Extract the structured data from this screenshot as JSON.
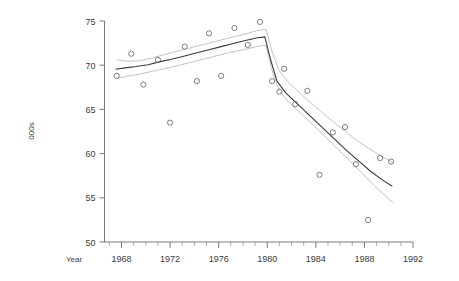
{
  "chart_data": {
    "type": "scatter",
    "title": "",
    "xlabel": "Year",
    "ylabel": "000s",
    "xlim": [
      1966.6,
      1992.0
    ],
    "ylim": [
      50,
      75
    ],
    "xticks": [
      1968,
      1972,
      1976,
      1980,
      1984,
      1988,
      1992
    ],
    "xticklabels": [
      "1968",
      "1972",
      "1976",
      "1980",
      "1984",
      "1988",
      "1992"
    ],
    "xticks_minor_step": 1,
    "yticks": [
      50,
      55,
      60,
      65,
      70,
      75
    ],
    "yticklabels": [
      "50",
      "55",
      "60",
      "65",
      "70",
      "75"
    ],
    "grid": false,
    "legend": null,
    "points": [
      {
        "x": 1967.6,
        "y": 68.8
      },
      {
        "x": 1968.8,
        "y": 71.3
      },
      {
        "x": 1969.8,
        "y": 67.8
      },
      {
        "x": 1971.0,
        "y": 70.6
      },
      {
        "x": 1972.0,
        "y": 63.5
      },
      {
        "x": 1973.2,
        "y": 72.1
      },
      {
        "x": 1974.2,
        "y": 68.2
      },
      {
        "x": 1975.2,
        "y": 73.6
      },
      {
        "x": 1976.2,
        "y": 68.8
      },
      {
        "x": 1977.3,
        "y": 74.2
      },
      {
        "x": 1978.4,
        "y": 72.3
      },
      {
        "x": 1979.4,
        "y": 74.9
      },
      {
        "x": 1980.4,
        "y": 68.2
      },
      {
        "x": 1981.0,
        "y": 67.0
      },
      {
        "x": 1981.4,
        "y": 69.6
      },
      {
        "x": 1982.3,
        "y": 65.6
      },
      {
        "x": 1983.3,
        "y": 67.1
      },
      {
        "x": 1984.3,
        "y": 57.6
      },
      {
        "x": 1985.4,
        "y": 62.4
      },
      {
        "x": 1986.4,
        "y": 63.0
      },
      {
        "x": 1987.3,
        "y": 58.8
      },
      {
        "x": 1988.3,
        "y": 52.5
      },
      {
        "x": 1989.3,
        "y": 59.5
      },
      {
        "x": 1990.2,
        "y": 59.1
      }
    ],
    "fit_curve": [
      {
        "x": 1967.5,
        "y": 69.55
      },
      {
        "x": 1968.3,
        "y": 69.7
      },
      {
        "x": 1969.2,
        "y": 69.85
      },
      {
        "x": 1970.2,
        "y": 70.05
      },
      {
        "x": 1971.2,
        "y": 70.4
      },
      {
        "x": 1972.2,
        "y": 70.7
      },
      {
        "x": 1973.2,
        "y": 71.05
      },
      {
        "x": 1974.2,
        "y": 71.4
      },
      {
        "x": 1975.2,
        "y": 71.75
      },
      {
        "x": 1976.2,
        "y": 72.1
      },
      {
        "x": 1977.2,
        "y": 72.45
      },
      {
        "x": 1978.2,
        "y": 72.8
      },
      {
        "x": 1979.2,
        "y": 73.1
      },
      {
        "x": 1979.8,
        "y": 73.2
      },
      {
        "x": 1980.3,
        "y": 70.5
      },
      {
        "x": 1980.8,
        "y": 68.2
      },
      {
        "x": 1981.5,
        "y": 66.9
      },
      {
        "x": 1982.5,
        "y": 65.6
      },
      {
        "x": 1983.5,
        "y": 64.3
      },
      {
        "x": 1984.5,
        "y": 63.0
      },
      {
        "x": 1985.5,
        "y": 61.7
      },
      {
        "x": 1986.5,
        "y": 60.4
      },
      {
        "x": 1987.5,
        "y": 59.2
      },
      {
        "x": 1988.5,
        "y": 58.0
      },
      {
        "x": 1989.5,
        "y": 57.0
      },
      {
        "x": 1990.3,
        "y": 56.3
      }
    ],
    "upper_band": [
      {
        "x": 1967.6,
        "y": 70.6
      },
      {
        "x": 1968.5,
        "y": 70.45
      },
      {
        "x": 1969.5,
        "y": 70.5
      },
      {
        "x": 1970.5,
        "y": 70.8
      },
      {
        "x": 1971.5,
        "y": 71.2
      },
      {
        "x": 1972.5,
        "y": 71.55
      },
      {
        "x": 1973.5,
        "y": 71.9
      },
      {
        "x": 1974.5,
        "y": 72.25
      },
      {
        "x": 1975.5,
        "y": 72.6
      },
      {
        "x": 1976.5,
        "y": 72.95
      },
      {
        "x": 1977.5,
        "y": 73.3
      },
      {
        "x": 1978.5,
        "y": 73.65
      },
      {
        "x": 1979.3,
        "y": 73.95
      },
      {
        "x": 1979.9,
        "y": 74.05
      },
      {
        "x": 1980.4,
        "y": 71.5
      },
      {
        "x": 1981.0,
        "y": 69.3
      },
      {
        "x": 1981.8,
        "y": 68.0
      },
      {
        "x": 1982.8,
        "y": 66.7
      },
      {
        "x": 1983.8,
        "y": 65.5
      },
      {
        "x": 1984.8,
        "y": 64.3
      },
      {
        "x": 1985.8,
        "y": 63.2
      },
      {
        "x": 1986.8,
        "y": 62.1
      },
      {
        "x": 1987.8,
        "y": 61.1
      },
      {
        "x": 1988.8,
        "y": 60.2
      },
      {
        "x": 1989.8,
        "y": 59.4
      },
      {
        "x": 1990.4,
        "y": 59.0
      }
    ],
    "lower_band": [
      {
        "x": 1967.6,
        "y": 68.5
      },
      {
        "x": 1968.5,
        "y": 68.75
      },
      {
        "x": 1969.5,
        "y": 69.0
      },
      {
        "x": 1970.5,
        "y": 69.3
      },
      {
        "x": 1971.5,
        "y": 69.6
      },
      {
        "x": 1972.5,
        "y": 69.9
      },
      {
        "x": 1973.5,
        "y": 70.25
      },
      {
        "x": 1974.5,
        "y": 70.6
      },
      {
        "x": 1975.5,
        "y": 70.95
      },
      {
        "x": 1976.5,
        "y": 71.3
      },
      {
        "x": 1977.5,
        "y": 71.6
      },
      {
        "x": 1978.5,
        "y": 71.9
      },
      {
        "x": 1979.3,
        "y": 72.15
      },
      {
        "x": 1979.9,
        "y": 72.25
      },
      {
        "x": 1980.4,
        "y": 69.4
      },
      {
        "x": 1981.0,
        "y": 67.1
      },
      {
        "x": 1981.8,
        "y": 65.8
      },
      {
        "x": 1982.8,
        "y": 64.5
      },
      {
        "x": 1983.8,
        "y": 63.2
      },
      {
        "x": 1984.8,
        "y": 61.9
      },
      {
        "x": 1985.8,
        "y": 60.5
      },
      {
        "x": 1986.8,
        "y": 59.2
      },
      {
        "x": 1987.8,
        "y": 57.8
      },
      {
        "x": 1988.8,
        "y": 56.4
      },
      {
        "x": 1989.8,
        "y": 55.1
      },
      {
        "x": 1990.4,
        "y": 54.4
      }
    ]
  }
}
